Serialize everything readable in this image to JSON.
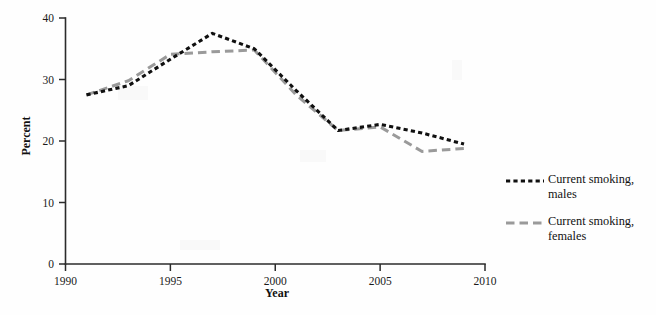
{
  "chart_data": {
    "type": "line",
    "title": "",
    "xlabel": "Year",
    "ylabel": "Percent",
    "xlim": [
      1990,
      2010
    ],
    "ylim": [
      0,
      40
    ],
    "xticks": [
      1990,
      1995,
      2000,
      2005,
      2010
    ],
    "xtick_labels": [
      "1990",
      "1995",
      "2000",
      "2005",
      "2010"
    ],
    "yticks": [
      0,
      10,
      20,
      30,
      40
    ],
    "ytick_labels": [
      "0",
      "10",
      "20",
      "30",
      "40"
    ],
    "grid": false,
    "legend_position": "right",
    "series": [
      {
        "name": "Current smoking, males",
        "color": "#101010",
        "style": "dotted",
        "x": [
          1991,
          1993,
          1995,
          1997,
          1999,
          2001,
          2003,
          2005,
          2007,
          2009
        ],
        "values": [
          27.5,
          29.0,
          33.3,
          37.5,
          35.0,
          28.2,
          21.7,
          22.7,
          21.3,
          19.5
        ]
      },
      {
        "name": "Current smoking, females",
        "color": "#9a9a9a",
        "style": "dashed",
        "x": [
          1991,
          1993,
          1995,
          1997,
          1999,
          2001,
          2003,
          2005,
          2007,
          2009
        ],
        "values": [
          27.5,
          29.8,
          34.1,
          34.5,
          34.8,
          27.5,
          21.7,
          22.3,
          18.3,
          18.8
        ]
      }
    ]
  },
  "axes": {
    "y_title": "Percent",
    "x_title": "Year"
  },
  "legend": {
    "entries": [
      {
        "label": "Current smoking,\nmales",
        "icon": "dotted-line-swatch"
      },
      {
        "label": "Current smoking,\nfemales",
        "icon": "dashed-line-swatch"
      }
    ]
  }
}
